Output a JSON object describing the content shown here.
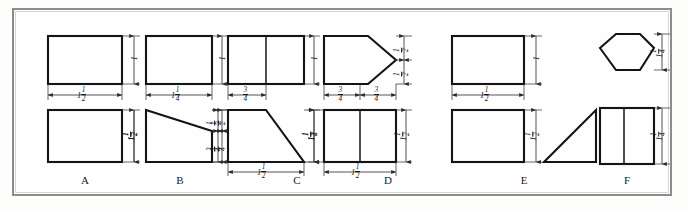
{
  "plate": {
    "title": "Orthographic Projection Exercise Plate",
    "frame_color": "#8c8c8c",
    "line_color": "#141414",
    "background": "#fdfdfc"
  },
  "groups": [
    {
      "id": "A",
      "label": "A",
      "top_view": {
        "shape": "rectangle",
        "note": "plain rectangle"
      },
      "front_view": {
        "shape": "rectangle",
        "note": "plain rectangle"
      },
      "dimensions": {
        "top_right": {
          "whole": "1",
          "num": "",
          "den": ""
        },
        "between": {
          "whole": "1",
          "num": "1",
          "den": "2"
        },
        "bottom_right": {
          "whole": "1",
          "num": "1",
          "den": "2"
        }
      }
    },
    {
      "id": "B",
      "label": "B",
      "top_view": {
        "shape": "rectangle",
        "note": "plain rectangle"
      },
      "front_view": {
        "shape": "trapezoid",
        "note": "slanted top edge descending left to right"
      },
      "dimensions": {
        "top_right": {
          "whole": "1",
          "num": "",
          "den": ""
        },
        "between": {
          "whole": "1",
          "num": "1",
          "den": "4"
        },
        "left_tall": {
          "whole": "1",
          "num": "1",
          "den": "2"
        },
        "right_upper": {
          "whole": "",
          "num": "1",
          "den": "2"
        },
        "right_lower": {
          "whole": "",
          "num": "3",
          "den": "4"
        }
      }
    },
    {
      "id": "C",
      "label": "C",
      "top_view": {
        "shape": "rectangle-divided",
        "note": "rectangle with vertical center line"
      },
      "front_view": {
        "shape": "right-trapezoid",
        "note": "slanted right edge"
      },
      "dimensions": {
        "top_right": {
          "whole": "1",
          "num": "",
          "den": ""
        },
        "between": {
          "whole": "",
          "num": "3",
          "den": "4"
        },
        "left_upper": {
          "whole": "",
          "num": "1",
          "den": "2"
        },
        "left_lower": {
          "whole": "",
          "num": "3",
          "den": "4"
        },
        "right_tall": {
          "whole": "1",
          "num": "1",
          "den": "2"
        },
        "bottom": {
          "whole": "1",
          "num": "1",
          "den": "2"
        }
      }
    },
    {
      "id": "D",
      "label": "D",
      "top_view": {
        "shape": "pentagon-arrow",
        "note": "rectangle with V point at right"
      },
      "front_view": {
        "shape": "rectangle-divided",
        "note": "rectangle with vertical center line"
      },
      "dimensions": {
        "right_upper": {
          "whole": "",
          "num": "1",
          "den": "2"
        },
        "right_lower": {
          "whole": "",
          "num": "1",
          "den": "2"
        },
        "between_left": {
          "whole": "",
          "num": "3",
          "den": "4"
        },
        "between_right": {
          "whole": "",
          "num": "3",
          "den": "4"
        },
        "left_tall": {
          "whole": "1",
          "num": "1",
          "den": "4"
        },
        "right_tall": {
          "whole": "1",
          "num": "1",
          "den": "2"
        },
        "bottom": {
          "whole": "1",
          "num": "1",
          "den": "2"
        }
      }
    },
    {
      "id": "E",
      "label": "E",
      "top_view": {
        "shape": "rectangle",
        "note": "plain rectangle"
      },
      "front_view": {
        "shape": "rectangle-plus-triangle",
        "note": "rectangle left, right triangle right"
      },
      "dimensions": {
        "top_right": {
          "whole": "1",
          "num": "",
          "den": ""
        },
        "between": {
          "whole": "1",
          "num": "1",
          "den": "2"
        },
        "bottom_mid": {
          "whole": "1",
          "num": "1",
          "den": "2"
        }
      }
    },
    {
      "id": "F",
      "label": "F",
      "top_view": {
        "shape": "hexagon",
        "note": "regular hexagon"
      },
      "front_view": {
        "shape": "rectangle-divided",
        "note": "rectangle with vertical center line"
      },
      "dimensions": {
        "top_right": {
          "whole": "1",
          "num": "1",
          "den": "4"
        },
        "bottom_right": {
          "whole": "1",
          "num": "1",
          "den": "4"
        }
      }
    }
  ]
}
